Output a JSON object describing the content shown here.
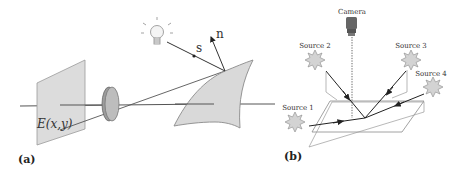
{
  "panel_a": {
    "label": "(a)",
    "image_plane_label": "E(x,y)",
    "light_vector_label": "s",
    "normal_vector_label": "n",
    "elements": [
      "image-plane",
      "lens",
      "optical-axis",
      "light-bulb",
      "surface-patch",
      "light-direction-vector",
      "surface-normal-vector",
      "projection-ray"
    ]
  },
  "panel_b": {
    "label": "(b)",
    "camera_label": "Camera",
    "sources": [
      {
        "label": "Source 1"
      },
      {
        "label": "Source 2"
      },
      {
        "label": "Source 3"
      },
      {
        "label": "Source 4"
      }
    ],
    "elements": [
      "camera",
      "dotted-view-line",
      "ground-plane",
      "incidence-planes",
      "light-rays"
    ]
  },
  "colors": {
    "fill_gray": "#d9d9d9",
    "line_dark": "#333333",
    "line_light": "#8a8a8a",
    "star_fill": "#cfcfcf"
  }
}
